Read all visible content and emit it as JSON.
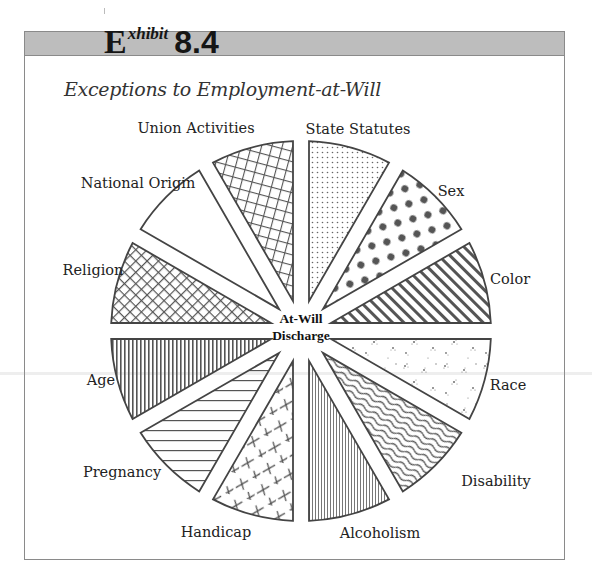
{
  "exhibit": {
    "letter": "E",
    "superscript": "xhibit",
    "number": "8.4"
  },
  "subtitle": "Exceptions to Employment-at-Will",
  "center_label": {
    "line1": "At-Will",
    "line2": "Discharge"
  },
  "colors": {
    "header_bar": "#bdbdbd",
    "frame": "#8a8a8a",
    "wedge_stroke": "#444444",
    "pattern_ink": "#555555"
  },
  "chart_data": {
    "type": "pie",
    "title": "Exceptions to Employment-at-Will",
    "center_text": "At-Will Discharge",
    "categories": [
      "State Statutes",
      "Sex",
      "Color",
      "Race",
      "Disability",
      "Alcoholism",
      "Handicap",
      "Pregnancy",
      "Age",
      "Religion",
      "National Origin",
      "Union Activities"
    ],
    "values": [
      1,
      1,
      1,
      1,
      1,
      1,
      1,
      1,
      1,
      1,
      1,
      1
    ],
    "patterns": [
      "fine-dots",
      "large-dots",
      "diagonal-stripes",
      "speckle",
      "wavy-lines",
      "fine-vertical-lines",
      "crosses",
      "horizontal-lines",
      "vertical-lines",
      "diagonal-crosshatch",
      "blank",
      "grid"
    ],
    "exploded": true,
    "legend": "labels-outside"
  },
  "labels": [
    {
      "text": "State Statutes",
      "x": 358,
      "y": 129
    },
    {
      "text": "Sex",
      "x": 451,
      "y": 191
    },
    {
      "text": "Color",
      "x": 510,
      "y": 279
    },
    {
      "text": "Race",
      "x": 508,
      "y": 385
    },
    {
      "text": "Disability",
      "x": 496,
      "y": 481
    },
    {
      "text": "Alcoholism",
      "x": 380,
      "y": 533
    },
    {
      "text": "Handicap",
      "x": 216,
      "y": 532
    },
    {
      "text": "Pregnancy",
      "x": 122,
      "y": 472
    },
    {
      "text": "Age",
      "x": 101,
      "y": 380
    },
    {
      "text": "Religion",
      "x": 93,
      "y": 270
    },
    {
      "text": "National Origin",
      "x": 138,
      "y": 183
    },
    {
      "text": "Union Activities",
      "x": 196,
      "y": 128
    }
  ]
}
